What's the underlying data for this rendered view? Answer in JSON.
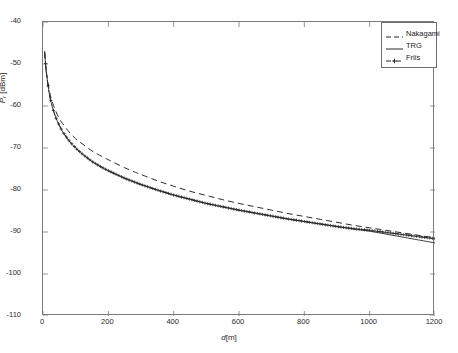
{
  "chart_data": {
    "type": "line",
    "title": "",
    "xlabel": "d [m]",
    "ylabel": "P_r [dBm]",
    "ylabel_symbol": "P",
    "ylabel_subscript": "r",
    "ylabel_unit": "[dBm]",
    "xlabel_symbol": "d",
    "xlabel_unit": "[m]",
    "xlim": [
      0,
      1200
    ],
    "ylim": [
      -110,
      -40
    ],
    "xticks": [
      0,
      200,
      400,
      600,
      800,
      1000,
      1200
    ],
    "yticks": [
      -40,
      -50,
      -60,
      -70,
      -80,
      -90,
      -100,
      -110
    ],
    "xtick_labels": [
      "0",
      "200",
      "400",
      "600",
      "800",
      "1000",
      "1200"
    ],
    "ytick_labels": [
      "-40",
      "-50",
      "-60",
      "-70",
      "-80",
      "-90",
      "-100",
      "-110"
    ],
    "grid": false,
    "legend_position": "top-right",
    "background": "#ffffff",
    "axis_color": "#7a7a7a",
    "series": [
      {
        "name": "Nakagami",
        "style": "dashed",
        "color": "#2b2b2b",
        "marker": "none",
        "x": [
          5,
          10,
          20,
          30,
          40,
          50,
          60,
          80,
          100,
          120,
          150,
          180,
          200,
          250,
          280,
          300,
          350,
          400,
          450,
          500,
          550,
          600,
          650,
          700,
          750,
          800,
          850,
          900,
          950,
          1000,
          1050,
          1100,
          1150,
          1200
        ],
        "values": [
          -47.3,
          -51.6,
          -56.6,
          -59.4,
          -61.4,
          -63.0,
          -64.2,
          -66.2,
          -67.8,
          -69.0,
          -70.7,
          -72.0,
          -72.8,
          -74.7,
          -75.7,
          -76.3,
          -77.8,
          -79.1,
          -80.3,
          -81.3,
          -82.3,
          -83.2,
          -84.0,
          -84.8,
          -85.6,
          -86.3,
          -87.0,
          -87.7,
          -88.4,
          -89.0,
          -89.6,
          -90.2,
          -90.8,
          -91.4
        ]
      },
      {
        "name": "TRG",
        "style": "solid",
        "color": "#2b2b2b",
        "marker": "none",
        "x": [
          5,
          10,
          20,
          30,
          40,
          50,
          60,
          80,
          100,
          120,
          150,
          180,
          200,
          250,
          280,
          300,
          350,
          400,
          450,
          500,
          550,
          600,
          650,
          700,
          750,
          800,
          850,
          900,
          950,
          1000,
          1050,
          1100,
          1150,
          1200
        ],
        "values": [
          -47.0,
          -51.8,
          -57.4,
          -60.6,
          -62.9,
          -64.6,
          -66.1,
          -68.3,
          -70.0,
          -71.4,
          -73.2,
          -74.6,
          -75.4,
          -77.2,
          -78.1,
          -78.7,
          -80.0,
          -81.2,
          -82.2,
          -83.2,
          -84.0,
          -84.8,
          -85.5,
          -86.2,
          -86.9,
          -87.5,
          -88.1,
          -88.7,
          -89.3,
          -89.8,
          -90.5,
          -91.2,
          -91.9,
          -92.6
        ]
      },
      {
        "name": "Friis",
        "style": "dash-dot",
        "color": "#2b2b2b",
        "marker": "cross",
        "x": [
          5,
          10,
          20,
          30,
          40,
          50,
          60,
          80,
          100,
          120,
          150,
          180,
          200,
          250,
          280,
          300,
          350,
          400,
          450,
          500,
          550,
          600,
          650,
          700,
          750,
          800,
          850,
          900,
          950,
          1000,
          1050,
          1100,
          1150,
          1200
        ],
        "values": [
          -47.0,
          -51.8,
          -57.4,
          -60.6,
          -62.9,
          -64.6,
          -66.1,
          -68.3,
          -70.0,
          -71.4,
          -73.2,
          -74.6,
          -75.4,
          -77.2,
          -78.1,
          -78.7,
          -80.0,
          -81.2,
          -82.2,
          -83.2,
          -84.0,
          -84.8,
          -85.5,
          -86.2,
          -86.9,
          -87.5,
          -88.1,
          -88.7,
          -89.2,
          -89.6,
          -90.1,
          -90.6,
          -91.1,
          -91.6
        ]
      }
    ],
    "legend_entries": [
      {
        "label": "Nakagami",
        "style": "dashed",
        "marker": "none"
      },
      {
        "label": "TRG",
        "style": "solid",
        "marker": "none"
      },
      {
        "label": "Friis",
        "style": "dash-dot",
        "marker": "cross"
      }
    ]
  }
}
